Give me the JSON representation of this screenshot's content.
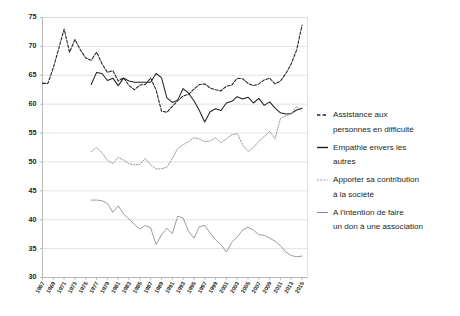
{
  "chart_data": {
    "type": "line",
    "title": "",
    "subtitle": "",
    "xlabel": "",
    "ylabel": "",
    "xlim": [
      1967,
      2016
    ],
    "ylim": [
      30,
      75
    ],
    "yticks": [
      30,
      35,
      40,
      45,
      50,
      55,
      60,
      65,
      70,
      75
    ],
    "ytick_labels": [
      "30",
      "35",
      "40",
      "45",
      "50",
      "55",
      "60",
      "65",
      "70",
      "75"
    ],
    "xticks": [
      1967,
      1969,
      1971,
      1973,
      1975,
      1977,
      1979,
      1981,
      1983,
      1985,
      1987,
      1989,
      1991,
      1993,
      1995,
      1997,
      1999,
      2001,
      2003,
      2005,
      2007,
      2009,
      2011,
      2013,
      2015
    ],
    "xtick_labels": [
      "1967",
      "1969",
      "1971",
      "1973",
      "1975",
      "1977",
      "1979",
      "1981",
      "1983",
      "1985",
      "1987",
      "1989",
      "1991",
      "1993",
      "1995",
      "1997",
      "1999",
      "2001",
      "2003",
      "2005",
      "2007",
      "2009",
      "2011",
      "2013",
      "2015"
    ],
    "grid": "horizontal",
    "legend_position": "right",
    "series": [
      {
        "name": "Assistance aux personnes en difficulté",
        "legend_label_line1": "Assistance aux",
        "legend_label_line2": "personnes en difficulté",
        "style": "dashed",
        "color": "#231f20",
        "x": [
          1967,
          1968,
          1969,
          1970,
          1971,
          1972,
          1973,
          1974,
          1975,
          1976,
          1977,
          1978,
          1979,
          1980,
          1981,
          1982,
          1983,
          1984,
          1985,
          1986,
          1987,
          1988,
          1989,
          1990,
          1991,
          1992,
          1993,
          1994,
          1995,
          1996,
          1997,
          1998,
          1999,
          2000,
          2001,
          2002,
          2003,
          2004,
          2005,
          2006,
          2007,
          2008,
          2009,
          2010,
          2011,
          2012,
          2013,
          2014,
          2015
        ],
        "values": [
          63.6,
          63.6,
          66.3,
          69.6,
          73.0,
          69.0,
          71.2,
          69.4,
          68.0,
          67.6,
          69.0,
          67.0,
          65.5,
          65.8,
          64.0,
          64.6,
          63.2,
          62.5,
          63.3,
          63.4,
          64.5,
          62.5,
          58.8,
          58.6,
          59.6,
          60.6,
          61.4,
          61.7,
          62.6,
          63.4,
          63.5,
          62.8,
          62.5,
          62.3,
          63.1,
          63.3,
          64.5,
          64.4,
          63.6,
          63.2,
          63.5,
          64.2,
          64.5,
          63.5,
          64.0,
          65.3,
          67.0,
          69.4,
          73.7
        ]
      },
      {
        "name": "Empathie envers les autres",
        "legend_label_line1": "Empathie envers les",
        "legend_label_line2": "autres",
        "style": "solid",
        "color": "#231f20",
        "x": [
          1976,
          1977,
          1978,
          1979,
          1980,
          1981,
          1982,
          1983,
          1984,
          1985,
          1986,
          1987,
          1988,
          1989,
          1990,
          1991,
          1992,
          1993,
          1994,
          1995,
          1996,
          1997,
          1998,
          1999,
          2000,
          2001,
          2002,
          2003,
          2004,
          2005,
          2006,
          2007,
          2008,
          2009,
          2010,
          2011,
          2012,
          2013,
          2014,
          2015
        ],
        "values": [
          63.4,
          65.5,
          65.3,
          64.1,
          64.5,
          63.2,
          64.5,
          64.0,
          63.8,
          63.8,
          63.8,
          63.8,
          65.3,
          64.6,
          61.1,
          60.3,
          60.7,
          62.7,
          61.9,
          60.6,
          58.9,
          56.9,
          58.7,
          59.2,
          58.9,
          60.2,
          60.5,
          61.3,
          60.9,
          61.2,
          60.2,
          61.0,
          59.8,
          60.4,
          59.3,
          58.5,
          58.3,
          58.4,
          59.0,
          59.3
        ]
      },
      {
        "name": "Apporter sa contribution à la société",
        "legend_label_line1": "Apporter sa contribution",
        "legend_label_line2": "à la société",
        "style": "dotted",
        "color": "#8a8a8a",
        "x": [
          1976,
          1977,
          1978,
          1979,
          1980,
          1981,
          1982,
          1983,
          1984,
          1985,
          1986,
          1987,
          1988,
          1989,
          1990,
          1991,
          1992,
          1993,
          1994,
          1995,
          1996,
          1997,
          1998,
          1999,
          2000,
          2001,
          2002,
          2003,
          2004,
          2005,
          2006,
          2007,
          2008,
          2009,
          2010,
          2011,
          2012,
          2013,
          2014,
          2015
        ],
        "values": [
          51.8,
          52.5,
          51.6,
          50.3,
          49.7,
          50.8,
          50.3,
          49.7,
          49.5,
          49.6,
          50.6,
          49.5,
          48.8,
          48.8,
          49.1,
          50.6,
          52.3,
          53.0,
          53.5,
          54.2,
          54.0,
          53.5,
          53.6,
          54.2,
          53.3,
          54.0,
          54.7,
          54.9,
          53.0,
          51.8,
          52.5,
          53.6,
          54.4,
          55.3,
          54.0,
          57.5,
          58.0,
          58.3,
          59.6,
          58.8
        ]
      },
      {
        "name": "A l'intention de faire un don à une association",
        "legend_label_line1": "A l’intention de faire",
        "legend_label_line2": "un don à une association",
        "style": "solid",
        "color": "#8a8a8a",
        "x": [
          1976,
          1977,
          1978,
          1979,
          1980,
          1981,
          1982,
          1983,
          1984,
          1985,
          1986,
          1987,
          1988,
          1989,
          1990,
          1991,
          1992,
          1993,
          1994,
          1995,
          1996,
          1997,
          1998,
          1999,
          2000,
          2001,
          2002,
          2003,
          2004,
          2005,
          2006,
          2007,
          2008,
          2009,
          2010,
          2011,
          2012,
          2013,
          2014,
          2015
        ],
        "values": [
          43.4,
          43.4,
          43.3,
          42.8,
          41.3,
          42.4,
          41.0,
          40.1,
          39.2,
          38.4,
          39.0,
          38.6,
          35.7,
          37.4,
          38.5,
          37.6,
          40.6,
          40.3,
          38.0,
          36.8,
          38.8,
          39.0,
          37.7,
          36.5,
          35.7,
          34.4,
          36.1,
          37.0,
          38.2,
          38.7,
          38.2,
          37.4,
          37.3,
          36.8,
          36.3,
          35.5,
          34.4,
          33.8,
          33.6,
          33.7
        ]
      }
    ]
  },
  "legend": {
    "entries": [
      {
        "marker": "dashed-black-line-icon",
        "line1": "Assistance aux",
        "line2": "personnes en difficulté"
      },
      {
        "marker": "solid-black-line-icon",
        "line1": "Empathie envers les",
        "line2": "autres"
      },
      {
        "marker": "dotted-gray-line-icon",
        "line1": "Apporter sa contribution",
        "line2": "à la société"
      },
      {
        "marker": "solid-gray-line-icon",
        "line1": "A l’intention de faire",
        "line2": "un don à une association"
      }
    ]
  },
  "colors": {
    "series_dark": "#231f20",
    "series_gray": "#8a8a8a",
    "grid": "#d9d9d9",
    "axis": "#b0b0b0",
    "background": "#ffffff"
  }
}
